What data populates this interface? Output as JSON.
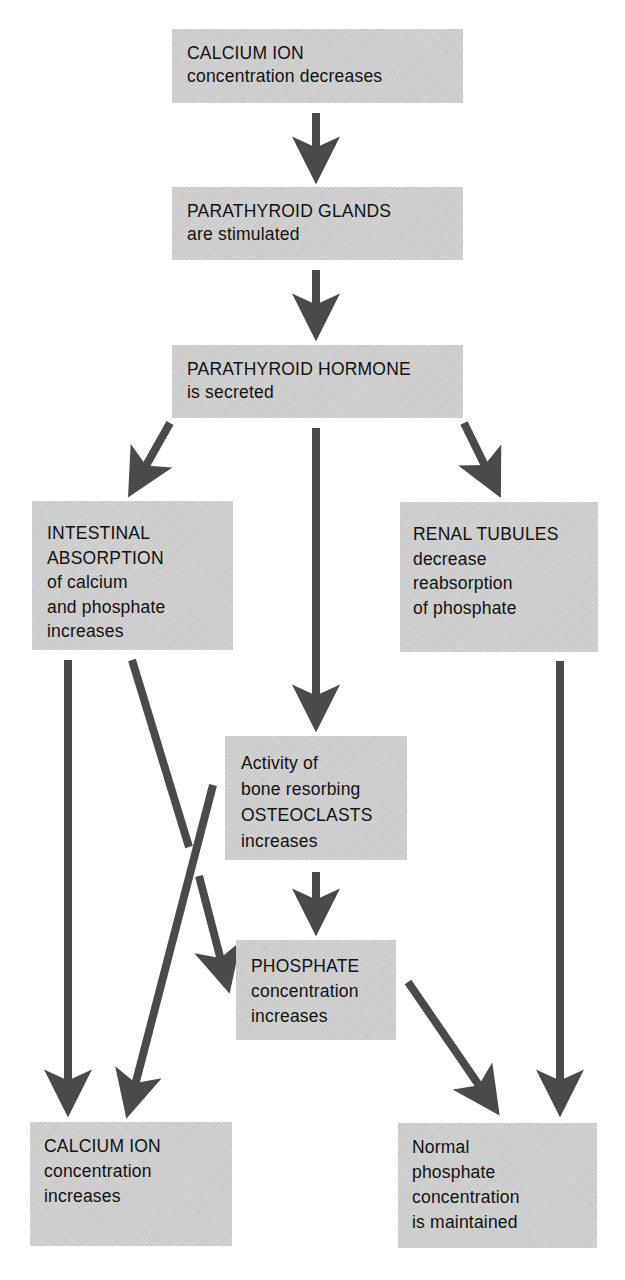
{
  "diagram": {
    "type": "flowchart",
    "colors": {
      "box_fill": "#cfcfcf",
      "arrow": "#4a4a4a",
      "text": "#111111",
      "background": "#ffffff"
    },
    "nodes": {
      "calcium_decreases": {
        "lines": [
          "CALCIUM ION",
          "concentration decreases"
        ]
      },
      "parathyroid_glands": {
        "lines": [
          "PARATHYROID GLANDS",
          "are stimulated"
        ]
      },
      "parathyroid_hormone": {
        "lines": [
          "PARATHYROID HORMONE",
          "is secreted"
        ]
      },
      "intestinal_absorption": {
        "lines": [
          "INTESTINAL",
          "ABSORPTION",
          "of calcium",
          "and phosphate",
          "increases"
        ]
      },
      "renal_tubules": {
        "lines": [
          "RENAL TUBULES",
          "decrease",
          "reabsorption",
          "of phosphate"
        ]
      },
      "osteoclasts": {
        "lines": [
          "Activity of",
          "bone resorbing",
          "OSTEOCLASTS",
          "increases"
        ]
      },
      "phosphate_increases": {
        "lines": [
          "PHOSPHATE",
          "concentration",
          "increases"
        ]
      },
      "calcium_increases": {
        "lines": [
          "CALCIUM ION",
          "concentration",
          "increases"
        ]
      },
      "normal_phosphate": {
        "lines": [
          "Normal",
          "phosphate",
          "concentration",
          "is maintained"
        ]
      }
    },
    "edges": [
      {
        "from": "calcium_decreases",
        "to": "parathyroid_glands"
      },
      {
        "from": "parathyroid_glands",
        "to": "parathyroid_hormone"
      },
      {
        "from": "parathyroid_hormone",
        "to": "intestinal_absorption"
      },
      {
        "from": "parathyroid_hormone",
        "to": "osteoclasts"
      },
      {
        "from": "parathyroid_hormone",
        "to": "renal_tubules"
      },
      {
        "from": "intestinal_absorption",
        "to": "calcium_increases"
      },
      {
        "from": "intestinal_absorption",
        "to": "phosphate_increases"
      },
      {
        "from": "osteoclasts",
        "to": "calcium_increases"
      },
      {
        "from": "osteoclasts",
        "to": "phosphate_increases"
      },
      {
        "from": "phosphate_increases",
        "to": "normal_phosphate"
      },
      {
        "from": "renal_tubules",
        "to": "normal_phosphate"
      }
    ]
  }
}
